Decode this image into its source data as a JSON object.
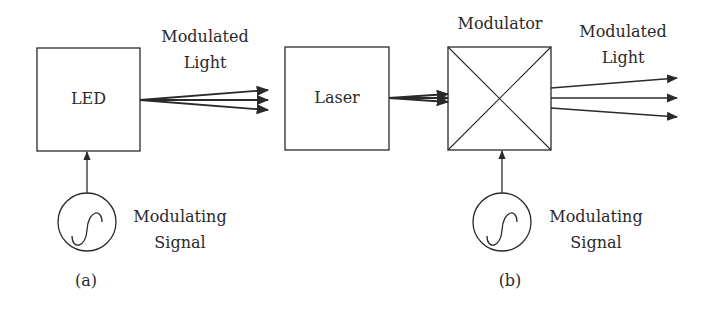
{
  "figure": {
    "panel_a": {
      "caption": "(a)",
      "source_box": {
        "label": "LED"
      },
      "output_label": {
        "line1": "Modulated",
        "line2": "Light"
      },
      "signal": {
        "line1": "Modulating",
        "line2": "Signal",
        "icon": "sine-wave-source-icon"
      }
    },
    "panel_b": {
      "caption": "(b)",
      "source_box": {
        "label": "Laser"
      },
      "modulator_label": "Modulator",
      "output_label": {
        "line1": "Modulated",
        "line2": "Light"
      },
      "signal": {
        "line1": "Modulating",
        "line2": "Signal",
        "icon": "sine-wave-source-icon"
      }
    },
    "colors": {
      "stroke": "#2a2a2a",
      "background": "#ffffff"
    }
  }
}
